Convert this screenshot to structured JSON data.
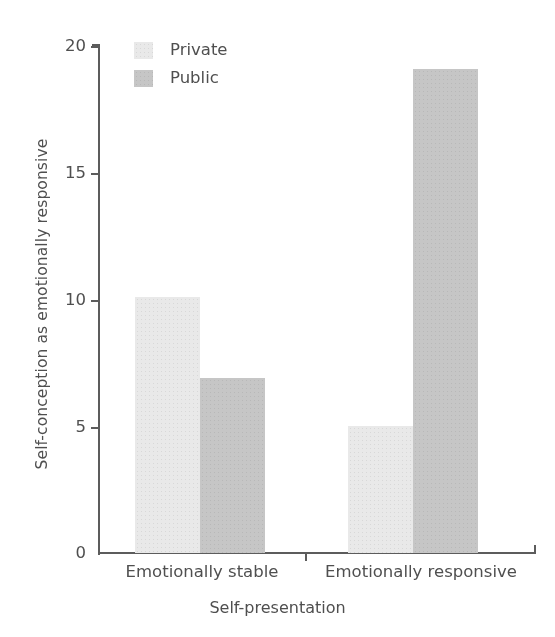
{
  "chart_data": {
    "type": "bar",
    "title": "",
    "xlabel": "Self-presentation",
    "ylabel": "Self-conception as emotionally responsive",
    "categories": [
      "Emotionally stable",
      "Emotionally responsive"
    ],
    "series": [
      {
        "name": "Private",
        "values": [
          10.1,
          5.0
        ],
        "color": "#e9e9e9"
      },
      {
        "name": "Public",
        "values": [
          6.9,
          19.1
        ],
        "color": "#c6c6c6"
      }
    ],
    "ylim": [
      0,
      20
    ],
    "yticks": [
      0,
      5,
      10,
      15,
      20
    ],
    "ytick_labels": [
      "0",
      "5",
      "10",
      "15",
      "20"
    ],
    "grid": false,
    "legend_position": "top-left-inside"
  },
  "axes": {
    "y_title": "Self-conception as emotionally responsive",
    "x_title": "Self-presentation",
    "y_tick_labels": [
      "20",
      "15",
      "10",
      "5",
      "0"
    ],
    "x_category_labels": [
      "Emotionally stable",
      "Emotionally responsive"
    ]
  },
  "legend": {
    "items": [
      {
        "label": "Private",
        "swatch": "legend-swatch-private"
      },
      {
        "label": "Public",
        "swatch": "legend-swatch-public"
      }
    ]
  },
  "colors": {
    "private": "#e9e9e9",
    "public": "#c6c6c6",
    "axis": "#5c5c5c",
    "text": "#4f4f4f",
    "background": "#ffffff"
  }
}
